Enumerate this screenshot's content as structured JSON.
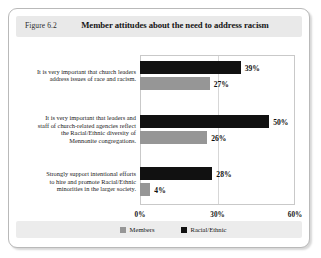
{
  "figure": {
    "number_label": "Figure 6.2",
    "title": "Member attitudes about the need to address racism"
  },
  "legend": {
    "items": [
      {
        "label": "Members",
        "color": "#969696",
        "swatch_name": "members-swatch"
      },
      {
        "label": "Racial/Ethnic",
        "color": "#111111",
        "swatch_name": "racial-ethnic-swatch"
      }
    ]
  },
  "axis": {
    "ticks": [
      "0%",
      "30%",
      "60%"
    ],
    "tick_values": [
      0,
      30,
      60
    ]
  },
  "chart_data": {
    "type": "bar",
    "orientation": "horizontal",
    "title": "Member attitudes about the need to address racism",
    "xlabel": "",
    "ylabel": "",
    "xlim": [
      0,
      60
    ],
    "xticks": [
      0,
      30,
      60
    ],
    "xticklabels": [
      "0%",
      "30%",
      "60%"
    ],
    "grid": true,
    "legend_position": "bottom",
    "categories": [
      "It is very important that church leaders address issues of race and racism.",
      "It is very important that leaders and staff of church-related agencies reflect the Racial/Ethnic diversity of Mennonite congregations.",
      "Strongly support intentional efforts to hire and promote Racial/Ethnic minorities in the larger society."
    ],
    "category_lines": [
      [
        "It is very important that church leaders",
        "address issues of race and racism."
      ],
      [
        "It is very important that leaders and",
        "staff of church-related agencies reflect",
        "the Racial/Ethnic diversity of",
        "Mennonite congregations."
      ],
      [
        "Strongly support intentional efforts",
        "to hire and promote Racial/Ethnic",
        "minorities in the larger society."
      ]
    ],
    "series": [
      {
        "name": "Racial/Ethnic",
        "color": "#111111",
        "values": [
          39,
          50,
          28
        ],
        "value_labels": [
          "39%",
          "50%",
          "28%"
        ]
      },
      {
        "name": "Members",
        "color": "#969696",
        "values": [
          27,
          26,
          4
        ],
        "value_labels": [
          "27%",
          "26%",
          "4%"
        ]
      }
    ]
  }
}
